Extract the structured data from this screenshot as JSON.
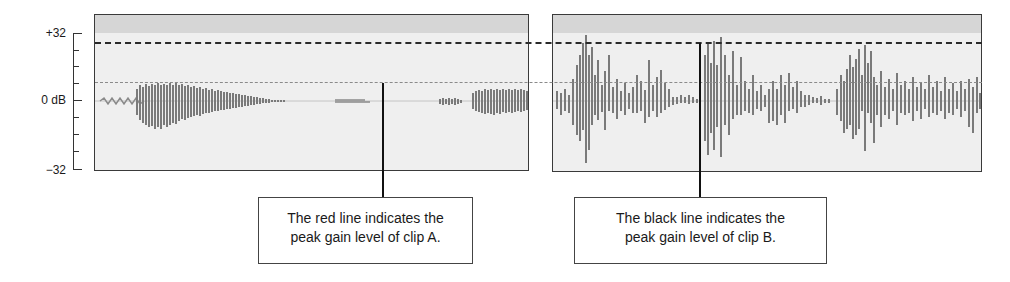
{
  "y_axis": {
    "top_label": "+32",
    "mid_label": "0 dB",
    "bottom_label": "−32",
    "range": [
      -32,
      32
    ],
    "tick_count": 9
  },
  "clips": [
    {
      "name": "clip A",
      "peak_line_color_label": "red"
    },
    {
      "name": "clip B",
      "peak_line_color_label": "black"
    }
  ],
  "callouts": {
    "a": {
      "line1": "The red line indicates the",
      "line2": "peak gain level of clip A."
    },
    "b": {
      "line1": "The black line indicates the",
      "line2": "peak gain level of clip B."
    }
  },
  "colors": {
    "panel_bg": "#efefef",
    "panel_header": "#d6d6d6",
    "waveform": "#7a7a7a",
    "peak_line_b": "#2a2a2a",
    "peak_line_a": "#8a8a8a"
  }
}
